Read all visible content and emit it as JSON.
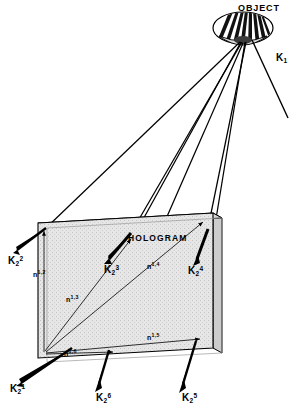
{
  "figure": {
    "title_object": "OBJECT",
    "title_hologram": "HOLOGRAM",
    "reference_beam": {
      "symbol": "K",
      "sub": "1",
      "sup": ""
    },
    "colors": {
      "ink": "#000000",
      "plate_face": "#e3e3e3",
      "plate_edge": "#c9c9c9",
      "background": "#ffffff"
    },
    "object": {
      "shape": "striped-ellipse-dome",
      "stripe_count": 13,
      "center": {
        "x": 243,
        "y": 28
      },
      "rx": 30,
      "ry": 16
    },
    "hologram_plate": {
      "front": [
        [
          38,
          223
        ],
        [
          213,
          213
        ],
        [
          213,
          348
        ],
        [
          38,
          358
        ]
      ],
      "thickness_px": 9,
      "label_position": {
        "x": 128,
        "y": 238
      }
    },
    "k_vectors": [
      {
        "name": "K2-1",
        "symbol": "K",
        "sub": "2",
        "sup": "1",
        "label_x": 14,
        "label_y": 392,
        "tip": [
          14,
          386
        ],
        "tail": [
          72,
          348
        ]
      },
      {
        "name": "K2-2",
        "symbol": "K",
        "sub": "2",
        "sup": "2",
        "label_x": 8,
        "label_y": 262,
        "tip": [
          10,
          252
        ],
        "tail": [
          46,
          228
        ]
      },
      {
        "name": "K2-3",
        "symbol": "K",
        "sub": "2",
        "sup": "3",
        "label_x": 103,
        "label_y": 271,
        "tip": [
          104,
          262
        ],
        "tail": [
          131,
          235
        ]
      },
      {
        "name": "K2-4",
        "symbol": "K",
        "sub": "2",
        "sup": "4",
        "label_x": 187,
        "label_y": 273,
        "tip": [
          193,
          264
        ],
        "tail": [
          208,
          230
        ]
      },
      {
        "name": "K2-5",
        "symbol": "K",
        "sub": "2",
        "sup": "5",
        "label_x": 185,
        "label_y": 401,
        "tip": [
          180,
          392
        ],
        "tail": [
          196,
          343
        ]
      },
      {
        "name": "K2-6",
        "symbol": "K",
        "sub": "2",
        "sup": "6",
        "label_x": 98,
        "label_y": 401,
        "tip": [
          95,
          391
        ],
        "tail": [
          109,
          351
        ]
      }
    ],
    "n_vectors": [
      {
        "name": "n-1-2",
        "symbol": "n",
        "sup": "1,2",
        "label_x": 33,
        "label_y": 276
      },
      {
        "name": "n-1-3",
        "symbol": "n",
        "sup": "1,3",
        "label_x": 67,
        "label_y": 300
      },
      {
        "name": "n-1-4",
        "symbol": "n",
        "sup": "1,4",
        "label_x": 147,
        "label_y": 268
      },
      {
        "name": "n-1-5",
        "symbol": "n",
        "sup": "1,5",
        "label_x": 147,
        "label_y": 339
      },
      {
        "name": "n-1-6",
        "symbol": "n",
        "sup": "1,6",
        "label_x": 64,
        "label_y": 355
      }
    ],
    "object_rays_count": 6,
    "caption_notes": "Holographic reconstruction geometry: object beam rays converge to hologram plate; reconstruction vectors K2^i exit the plate; in-plane grating vectors n^1,i drawn on the plate face."
  }
}
